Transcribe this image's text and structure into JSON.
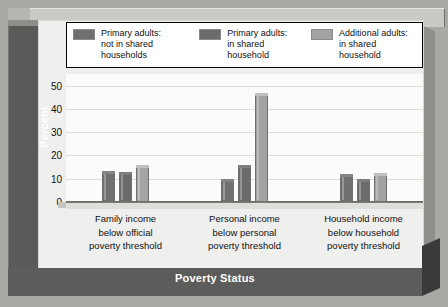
{
  "chart_data": {
    "type": "bar",
    "title": "",
    "xlabel": "Poverty Status",
    "ylabel": "Percent",
    "ylim": [
      0,
      55
    ],
    "yticks": [
      0,
      10,
      20,
      30,
      40,
      50
    ],
    "grid": true,
    "legend_position": "top",
    "categories": [
      "Family income\nbelow official\npoverty threshold",
      "Personal income\nbelow personal\npoverty threshold",
      "Household income\nbelow household\npoverty threshold"
    ],
    "series": [
      {
        "name": "Primary adults:\nnot in shared\nhouseholds",
        "color": "#707070",
        "values": [
          13.5,
          10,
          12
        ]
      },
      {
        "name": "Primary adults:\nin shared\nhousehold",
        "color": "#6b6b6b",
        "values": [
          13,
          16,
          10
        ]
      },
      {
        "name": "Additional adults:\nin shared\nhousehold",
        "color": "#a3a3a3",
        "values": [
          16,
          47,
          12.5
        ]
      }
    ]
  },
  "colors": {
    "frame_dark": "#5a5a58",
    "frame_light": "#c9c9c5",
    "page_bg": "#efefed",
    "plot_bg": "#fbfbfa",
    "gridline": "#dcdcd8",
    "text": "#111111",
    "title_text": "#ffffff"
  },
  "axis": {
    "y_title": "Percent",
    "x_title": "Poverty Status",
    "y_tick_labels": [
      "50",
      "40",
      "30",
      "20",
      "10",
      "0"
    ]
  }
}
